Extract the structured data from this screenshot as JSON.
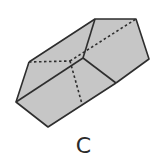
{
  "figure": {
    "label": "C",
    "shape": "pentagonal-prism",
    "colors": {
      "fill": "#c6c6c6",
      "edge": "#2e2e2e",
      "background": "#ffffff"
    }
  }
}
